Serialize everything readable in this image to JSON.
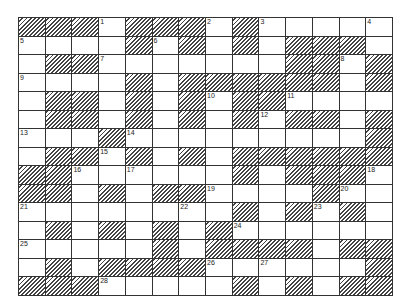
{
  "puzzle": {
    "type": "crossword",
    "columns": 14,
    "rows": 15,
    "colors": {
      "line": "#333333",
      "block_hatch": "#444444",
      "cell": "#ffffff"
    },
    "legend": "B = shaded/blocked cell, W = white cell, number = clue number in white cell",
    "grid": [
      [
        "B",
        "B",
        "B",
        "1",
        "B",
        "B",
        "B",
        "2",
        "B",
        "3",
        "W",
        "W",
        "W",
        "4"
      ],
      [
        "5",
        "W",
        "W",
        "W",
        "B",
        "6",
        "B",
        "W",
        "B",
        "W",
        "B",
        "B",
        "B",
        "W"
      ],
      [
        "W",
        "B",
        "B",
        "7",
        "W",
        "W",
        "W",
        "W",
        "W",
        "W",
        "B",
        "B",
        "8",
        "B"
      ],
      [
        "9",
        "W",
        "W",
        "W",
        "B",
        "W",
        "B",
        "B",
        "B",
        "B",
        "B",
        "B",
        "W",
        "B"
      ],
      [
        "W",
        "B",
        "B",
        "W",
        "B",
        "W",
        "B",
        "10",
        "B",
        "B",
        "11",
        "W",
        "W",
        "W"
      ],
      [
        "W",
        "B",
        "B",
        "W",
        "B",
        "W",
        "B",
        "W",
        "B",
        "12",
        "B",
        "B",
        "W",
        "B"
      ],
      [
        "13",
        "W",
        "W",
        "B",
        "14",
        "W",
        "W",
        "W",
        "W",
        "W",
        "W",
        "W",
        "W",
        "B"
      ],
      [
        "W",
        "B",
        "B",
        "15",
        "B",
        "W",
        "B",
        "W",
        "B",
        "B",
        "B",
        "B",
        "B",
        "B"
      ],
      [
        "B",
        "B",
        "16",
        "W",
        "17",
        "W",
        "W",
        "W",
        "B",
        "W",
        "B",
        "B",
        "B",
        "18"
      ],
      [
        "B",
        "B",
        "W",
        "B",
        "W",
        "B",
        "B",
        "19",
        "W",
        "W",
        "W",
        "B",
        "20",
        "W"
      ],
      [
        "21",
        "W",
        "W",
        "W",
        "W",
        "W",
        "22",
        "W",
        "B",
        "W",
        "B",
        "23",
        "B",
        "W"
      ],
      [
        "W",
        "B",
        "W",
        "B",
        "W",
        "B",
        "W",
        "B",
        "24",
        "W",
        "W",
        "W",
        "W",
        "W"
      ],
      [
        "25",
        "W",
        "W",
        "W",
        "W",
        "B",
        "W",
        "B",
        "B",
        "B",
        "B",
        "W",
        "B",
        "B"
      ],
      [
        "W",
        "B",
        "W",
        "B",
        "B",
        "B",
        "B",
        "26",
        "W",
        "27",
        "W",
        "W",
        "W",
        "B"
      ],
      [
        "B",
        "B",
        "B",
        "28",
        "W",
        "W",
        "W",
        "W",
        "B",
        "W",
        "B",
        "W",
        "B",
        "B"
      ]
    ]
  }
}
